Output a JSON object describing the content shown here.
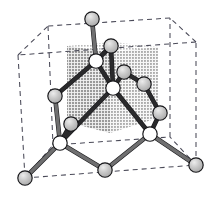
{
  "figure": {
    "background_color": "#ffffff"
  },
  "colors": {
    "cell_edge": "#4a4a58",
    "bond": "#6f6f70",
    "bond_dark": "#2a2a2c",
    "atom_gray_fill": "#b6b6b6",
    "atom_gray_highlight": "#e2e2e2",
    "atom_white_fill": "#ffffff",
    "atom_stroke": "#17171a",
    "octant_top_shade": "#cfcfcf",
    "octant_left_shade": "#a8a8a8",
    "octant_right_shade": "#bdbdbd"
  },
  "unit_cell": {
    "label": "cubic unit cell",
    "style": "dashed",
    "vertices": {
      "front_bottom_left": [
        25,
        178
      ],
      "front_bottom_right": [
        196,
        165
      ],
      "front_top_left": [
        18,
        55
      ],
      "front_top_right": [
        196,
        42
      ],
      "back_bottom_left": [
        53,
        145
      ],
      "back_bottom_right": [
        170,
        137
      ],
      "back_top_left": [
        48,
        26
      ],
      "back_top_right": [
        170,
        18
      ]
    },
    "edges": [
      [
        "front_bottom_left",
        "front_bottom_right"
      ],
      [
        "front_bottom_right",
        "front_top_right"
      ],
      [
        "front_top_right",
        "front_top_left"
      ],
      [
        "front_top_left",
        "front_bottom_left"
      ],
      [
        "back_bottom_left",
        "back_bottom_right"
      ],
      [
        "back_bottom_right",
        "back_top_right"
      ],
      [
        "back_top_right",
        "back_top_left"
      ],
      [
        "back_top_left",
        "back_bottom_left"
      ],
      [
        "front_bottom_left",
        "back_bottom_left"
      ],
      [
        "front_bottom_right",
        "back_bottom_right"
      ],
      [
        "front_top_left",
        "back_top_left"
      ],
      [
        "front_top_right",
        "back_top_right"
      ]
    ]
  },
  "shaded_octant": {
    "label": "shaded octant cube",
    "pattern": "halftone-gray",
    "top_face": [
      [
        67,
        46
      ],
      [
        113,
        42
      ],
      [
        158,
        47
      ],
      [
        110,
        52
      ]
    ],
    "left_face": [
      [
        67,
        46
      ],
      [
        110,
        52
      ],
      [
        110,
        133
      ],
      [
        67,
        122
      ]
    ],
    "right_face": [
      [
        110,
        52
      ],
      [
        158,
        47
      ],
      [
        158,
        118
      ],
      [
        110,
        133
      ]
    ]
  },
  "atoms": [
    {
      "id": "a1",
      "type": "corner",
      "shade": "gray",
      "cx": 92,
      "cy": 19,
      "r": 7.2
    },
    {
      "id": "a2",
      "type": "interior",
      "shade": "gray",
      "cx": 111,
      "cy": 46,
      "r": 7.2
    },
    {
      "id": "a3",
      "type": "interior",
      "shade": "white",
      "cx": 96,
      "cy": 61,
      "r": 7.2
    },
    {
      "id": "a4",
      "type": "interior",
      "shade": "gray",
      "cx": 124,
      "cy": 72,
      "r": 7.2
    },
    {
      "id": "a5",
      "type": "interior",
      "shade": "white",
      "cx": 113,
      "cy": 88,
      "r": 7.2
    },
    {
      "id": "a6",
      "type": "interior",
      "shade": "gray",
      "cx": 144,
      "cy": 84,
      "r": 7.2
    },
    {
      "id": "a7",
      "type": "face",
      "shade": "gray",
      "cx": 55,
      "cy": 96,
      "r": 7.2
    },
    {
      "id": "a8",
      "type": "interior",
      "shade": "gray",
      "cx": 71,
      "cy": 124,
      "r": 7.2
    },
    {
      "id": "a9",
      "type": "interior",
      "shade": "white",
      "cx": 60,
      "cy": 143,
      "r": 7.2
    },
    {
      "id": "a10",
      "type": "interior",
      "shade": "gray",
      "cx": 160,
      "cy": 113,
      "r": 7.2
    },
    {
      "id": "a11",
      "type": "interior",
      "shade": "white",
      "cx": 150,
      "cy": 134,
      "r": 7.2
    },
    {
      "id": "a12",
      "type": "corner",
      "shade": "gray",
      "cx": 25,
      "cy": 178,
      "r": 7.2
    },
    {
      "id": "a13",
      "type": "edge",
      "shade": "gray",
      "cx": 105,
      "cy": 170,
      "r": 7.2
    },
    {
      "id": "a14",
      "type": "corner",
      "shade": "gray",
      "cx": 196,
      "cy": 165,
      "r": 7.2
    }
  ],
  "bonds": [
    {
      "from": "a1",
      "to": "a3",
      "tone": "light"
    },
    {
      "from": "a2",
      "to": "a3",
      "tone": "dark"
    },
    {
      "from": "a2",
      "to": "a5",
      "tone": "dark"
    },
    {
      "from": "a3",
      "to": "a5",
      "tone": "dark"
    },
    {
      "from": "a4",
      "to": "a5",
      "tone": "dark"
    },
    {
      "from": "a4",
      "to": "a6",
      "tone": "dark"
    },
    {
      "from": "a5",
      "to": "a11",
      "tone": "dark"
    },
    {
      "from": "a5",
      "to": "a9",
      "tone": "dark"
    },
    {
      "from": "a6",
      "to": "a10",
      "tone": "dark"
    },
    {
      "from": "a3",
      "to": "a7",
      "tone": "dark"
    },
    {
      "from": "a7",
      "to": "a9",
      "tone": "light"
    },
    {
      "from": "a8",
      "to": "a9",
      "tone": "dark"
    },
    {
      "from": "a9",
      "to": "a12",
      "tone": "light"
    },
    {
      "from": "a9",
      "to": "a13",
      "tone": "light"
    },
    {
      "from": "a10",
      "to": "a11",
      "tone": "dark"
    },
    {
      "from": "a11",
      "to": "a13",
      "tone": "light"
    },
    {
      "from": "a11",
      "to": "a14",
      "tone": "light"
    }
  ]
}
